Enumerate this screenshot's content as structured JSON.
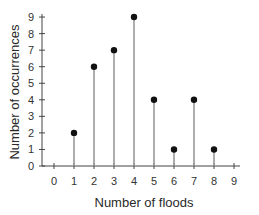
{
  "chart_data": {
    "type": "stem",
    "title": "",
    "xlabel": "Number of floods",
    "ylabel": "Number of occurrences",
    "x": [
      0,
      1,
      2,
      3,
      4,
      5,
      6,
      7,
      8,
      9
    ],
    "values": [
      0,
      2,
      6,
      7,
      9,
      4,
      1,
      4,
      1,
      0
    ],
    "points": [
      {
        "x": 1,
        "y": 2
      },
      {
        "x": 2,
        "y": 6
      },
      {
        "x": 3,
        "y": 7
      },
      {
        "x": 4,
        "y": 9
      },
      {
        "x": 5,
        "y": 4
      },
      {
        "x": 6,
        "y": 1
      },
      {
        "x": 7,
        "y": 4
      },
      {
        "x": 8,
        "y": 1
      }
    ],
    "xticks": [
      0,
      1,
      2,
      3,
      4,
      5,
      6,
      7,
      8,
      9
    ],
    "yticks": [
      0,
      1,
      2,
      3,
      4,
      5,
      6,
      7,
      8,
      9
    ],
    "xlim": [
      0,
      9
    ],
    "ylim": [
      0,
      9
    ],
    "grid": false,
    "legend": null
  },
  "style": {
    "axis_color": "#444444",
    "stem_color": "#9a9a9a",
    "marker_color": "#111111"
  }
}
